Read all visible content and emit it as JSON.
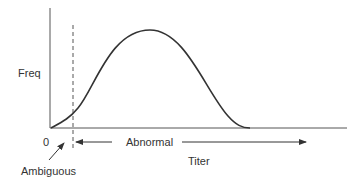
{
  "diagram": {
    "y_axis_label": "Freq",
    "x_axis_label": "Titer",
    "origin_label": "0",
    "region_labels": {
      "abnormal": "Abnormal",
      "ambiguous": "Ambiguous"
    },
    "colors": {
      "line": "#333333",
      "axis": "#555555",
      "background": "#ffffff"
    }
  }
}
